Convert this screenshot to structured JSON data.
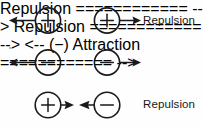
{
  "diagram": {
    "stroke_color": "#1a1a1c",
    "text_color": "#18181a",
    "background_color": "#fefefe",
    "rows": [
      {
        "id": "row-1",
        "left_particle": {
          "charge": "+",
          "sign_label": "plus",
          "arrow_direction": "left"
        },
        "right_particle": {
          "charge": "+",
          "sign_label": "plus",
          "arrow_direction": "right"
        },
        "label": "Repulsion"
      },
      {
        "id": "row-2",
        "left_particle": {
          "charge": "−",
          "sign_label": "minus",
          "arrow_direction": "left"
        },
        "right_particle": {
          "charge": "−",
          "sign_label": "minus",
          "arrow_direction": "right"
        },
        "label": "Repulsion"
      },
      {
        "id": "row-3",
        "left_particle": {
          "charge": "+",
          "sign_label": "plus",
          "arrow_direction": "right"
        },
        "right_particle": {
          "charge": "−",
          "sign_label": "minus",
          "arrow_direction": "left"
        },
        "label": "Attraction"
      }
    ]
  }
}
